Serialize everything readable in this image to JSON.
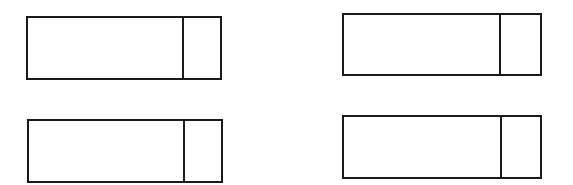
{
  "diagram": {
    "stroke_color": "#1a1a1a",
    "background": "#ffffff",
    "boxes": [
      {
        "id": "top-left",
        "label": "",
        "side_label": ""
      },
      {
        "id": "top-right",
        "label": "",
        "side_label": ""
      },
      {
        "id": "bottom-left",
        "label": "",
        "side_label": ""
      },
      {
        "id": "bottom-right",
        "label": "",
        "side_label": ""
      }
    ]
  }
}
